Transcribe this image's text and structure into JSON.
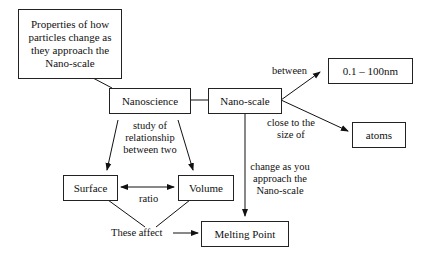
{
  "nodes": {
    "properties": "Properties of how particles change as they approach the Nano-scale",
    "nanoscience": "Nanoscience",
    "nanoscale": "Nano-scale",
    "range": "0.1 – 100nm",
    "atoms": "atoms",
    "surface": "Surface",
    "volume": "Volume",
    "melting_point": "Melting Point"
  },
  "edges": {
    "between": "between",
    "close_to_size_line1": "close to the",
    "close_to_size_line2": "size of",
    "study_line1": "study of",
    "study_line2": "relationship",
    "study_line3": "between two",
    "ratio": "ratio",
    "change_line1": "change as you",
    "change_line2": "approach the",
    "change_line3": "Nano-scale",
    "these_affect": "These affect"
  }
}
